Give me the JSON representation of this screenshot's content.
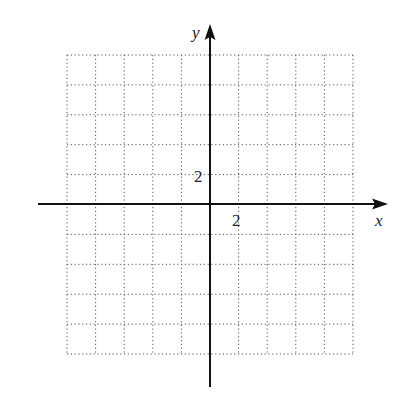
{
  "chart_data": {
    "type": "grid",
    "title": "",
    "xlabel": "x",
    "ylabel": "y",
    "x_tick_label": "2",
    "y_tick_label": "2",
    "grid": true,
    "grid_style": "dotted",
    "grid_columns": 10,
    "grid_rows": 10,
    "grid_step": 1,
    "xlim": [
      -10,
      10
    ],
    "ylim": [
      -10,
      10
    ],
    "tick_scale": 2
  },
  "colors": {
    "axis": "#111111",
    "grid": "#555555",
    "background": "#ffffff"
  }
}
